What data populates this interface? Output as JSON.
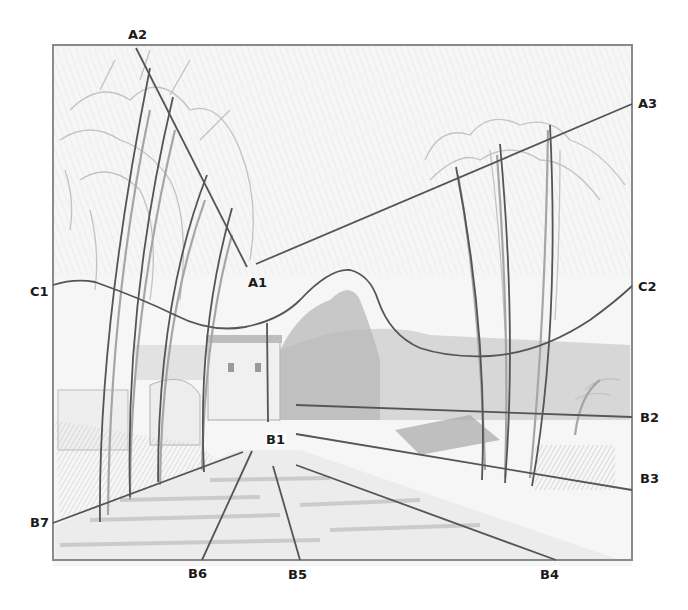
{
  "figure": {
    "frame": {
      "x": 52,
      "y": 44,
      "width": 240,
      "height": 218
    },
    "colors": {
      "line": "#5a5a5a",
      "frame": "#8a8a8a",
      "label": "#1a1a1a",
      "paper": "#f4f4f4",
      "sketch": "#b5b5b5"
    }
  },
  "labels": {
    "A1": "A1",
    "A2": "A2",
    "A3": "A3",
    "B1": "B1",
    "B2": "B2",
    "B3": "B3",
    "B4": "B4",
    "B5": "B5",
    "B6": "B6",
    "B7": "B7",
    "C1": "C1",
    "C2": "C2"
  },
  "label_positions": [
    {
      "id": "A2",
      "x": 128,
      "y": 28
    },
    {
      "id": "A3",
      "x": 638,
      "y": 97
    },
    {
      "id": "A1",
      "x": 248,
      "y": 276
    },
    {
      "id": "C1",
      "x": 30,
      "y": 285
    },
    {
      "id": "C2",
      "x": 638,
      "y": 280
    },
    {
      "id": "B1",
      "x": 265,
      "y": 433
    },
    {
      "id": "B2",
      "x": 640,
      "y": 411
    },
    {
      "id": "B3",
      "x": 640,
      "y": 472
    },
    {
      "id": "B4",
      "x": 540,
      "y": 568
    },
    {
      "id": "B5",
      "x": 288,
      "y": 568
    },
    {
      "id": "B6",
      "x": 188,
      "y": 567
    },
    {
      "id": "B7",
      "x": 30,
      "y": 516
    }
  ]
}
